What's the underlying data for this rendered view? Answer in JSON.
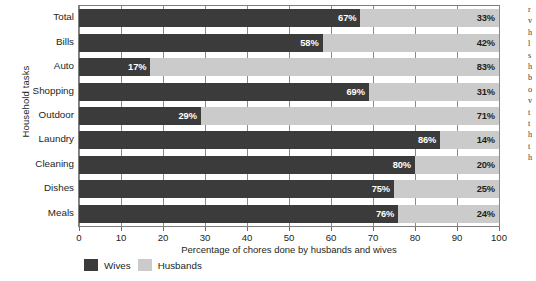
{
  "chart_data": {
    "type": "bar",
    "orientation": "horizontal",
    "stacked": true,
    "stack_total": 100,
    "title": "",
    "xlabel": "Percentage of chores done by husbands and wives",
    "ylabel": "Household tasks",
    "xlim": [
      0,
      100
    ],
    "xticks": [
      0,
      10,
      20,
      30,
      40,
      50,
      60,
      70,
      80,
      90,
      100
    ],
    "xtick_labels": [
      "0",
      "10",
      "20",
      "30",
      "40",
      "50",
      "60",
      "70",
      "80",
      "90",
      "100"
    ],
    "grid": true,
    "grid_axis": "x",
    "legend_position": "bottom-left",
    "categories": [
      "Total",
      "Bills",
      "Auto",
      "Shopping",
      "Outdoor",
      "Laundry",
      "Cleaning",
      "Dishes",
      "Meals"
    ],
    "series": [
      {
        "name": "Wives",
        "color": "#3b3b3b",
        "values": [
          67,
          58,
          17,
          69,
          29,
          86,
          80,
          75,
          76
        ],
        "labels": [
          "67%",
          "58%",
          "17%",
          "69%",
          "29%",
          "86%",
          "80%",
          "75%",
          "76%"
        ]
      },
      {
        "name": "Husbands",
        "color": "#cbcbcb",
        "values": [
          33,
          42,
          83,
          31,
          71,
          14,
          20,
          25,
          24
        ],
        "labels": [
          "33%",
          "42%",
          "83%",
          "31%",
          "71%",
          "14%",
          "20%",
          "25%",
          "24%"
        ]
      }
    ]
  },
  "axes": {
    "y_title": "Household tasks",
    "x_title": "Percentage of chores done by husbands and wives"
  },
  "legend": {
    "items": [
      {
        "label": "Wives",
        "color": "#3b3b3b"
      },
      {
        "label": "Husbands",
        "color": "#cbcbcb"
      }
    ]
  },
  "margin_text_fragments": [
    "r",
    "v",
    "h",
    "l",
    "s",
    "h",
    "b",
    "o",
    "v",
    "t",
    "t",
    "h",
    "t",
    "h"
  ]
}
